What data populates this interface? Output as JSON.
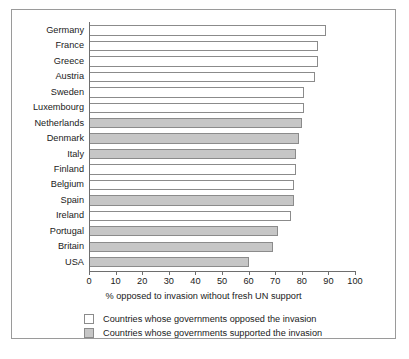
{
  "chart_data": {
    "type": "bar",
    "orientation": "horizontal",
    "title": "",
    "xlabel": "% opposed to invasion without fresh UN support",
    "ylabel": "",
    "xlim": [
      0,
      100
    ],
    "xticks": [
      0,
      10,
      20,
      30,
      40,
      50,
      60,
      70,
      80,
      90,
      100
    ],
    "grid": false,
    "legend_position": "bottom",
    "categories": [
      "Germany",
      "France",
      "Greece",
      "Austria",
      "Sweden",
      "Luxembourg",
      "Netherlands",
      "Denmark",
      "Italy",
      "Finland",
      "Belgium",
      "Spain",
      "Ireland",
      "Portugal",
      "Britain",
      "USA"
    ],
    "values": [
      89,
      86,
      86,
      85,
      81,
      81,
      80,
      79,
      78,
      78,
      77,
      77,
      76,
      71,
      69,
      60
    ],
    "groups": [
      "opposed",
      "opposed",
      "opposed",
      "opposed",
      "opposed",
      "opposed",
      "supported",
      "supported",
      "supported",
      "opposed",
      "opposed",
      "supported",
      "opposed",
      "supported",
      "supported",
      "supported"
    ],
    "bars": [
      {
        "label": "Germany",
        "value": 89,
        "group": "opposed"
      },
      {
        "label": "France",
        "value": 86,
        "group": "opposed"
      },
      {
        "label": "Greece",
        "value": 86,
        "group": "opposed"
      },
      {
        "label": "Austria",
        "value": 85,
        "group": "opposed"
      },
      {
        "label": "Sweden",
        "value": 81,
        "group": "opposed"
      },
      {
        "label": "Luxembourg",
        "value": 81,
        "group": "opposed"
      },
      {
        "label": "Netherlands",
        "value": 80,
        "group": "supported"
      },
      {
        "label": "Denmark",
        "value": 79,
        "group": "supported"
      },
      {
        "label": "Italy",
        "value": 78,
        "group": "supported"
      },
      {
        "label": "Finland",
        "value": 78,
        "group": "opposed"
      },
      {
        "label": "Belgium",
        "value": 77,
        "group": "opposed"
      },
      {
        "label": "Spain",
        "value": 77,
        "group": "supported"
      },
      {
        "label": "Ireland",
        "value": 76,
        "group": "opposed"
      },
      {
        "label": "Portugal",
        "value": 71,
        "group": "supported"
      },
      {
        "label": "Britain",
        "value": 69,
        "group": "supported"
      },
      {
        "label": "USA",
        "value": 60,
        "group": "supported"
      }
    ],
    "legend": [
      {
        "key": "opposed",
        "label": "Countries whose governments opposed the invasion",
        "color": "#ffffff"
      },
      {
        "key": "supported",
        "label": "Countries whose governments supported the invasion",
        "color": "#c6c6c6"
      }
    ],
    "colors": {
      "opposed_fill": "#ffffff",
      "supported_fill": "#c6c6c6",
      "bar_outline": "#8b8b8b",
      "axis": "#6e6e6e",
      "frame": "#9a9a9a",
      "text": "#1a1a1a",
      "background": "#ffffff"
    }
  }
}
